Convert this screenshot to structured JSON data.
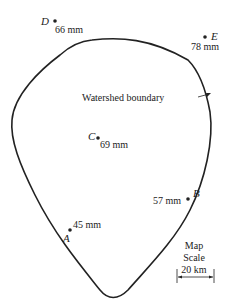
{
  "boundary_label": "Watershed boundary",
  "stations": [
    {
      "id": "D",
      "value": "66 mm"
    },
    {
      "id": "E",
      "value": "78 mm"
    },
    {
      "id": "C",
      "value": "69 mm"
    },
    {
      "id": "B",
      "value": "57 mm"
    },
    {
      "id": "A",
      "value": "45 mm"
    }
  ],
  "scale": {
    "line1": "Map",
    "line2": "Scale",
    "distance": "20 km"
  },
  "colors": {
    "ink": "#222222",
    "background": "#ffffff"
  }
}
